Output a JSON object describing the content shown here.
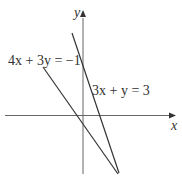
{
  "diagram": {
    "axes": {
      "x_label": "x",
      "y_label": "y"
    },
    "lines": [
      {
        "equation": "4x + 3y = −1",
        "label": "4x + 3y = −1"
      },
      {
        "equation": "3x + y = 3",
        "label": "3x + y = 3"
      }
    ],
    "colors": {
      "line": "#333333",
      "axis": "#555555",
      "background": "#ffffff"
    }
  }
}
